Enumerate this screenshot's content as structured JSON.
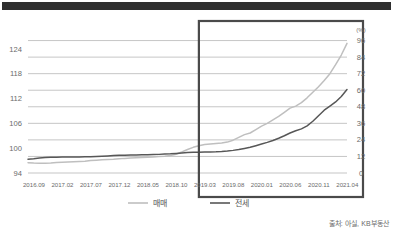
{
  "figure": {
    "topbar_name": "header-rule",
    "source": "출처: 아실, KB부동산"
  },
  "chart_data": {
    "type": "line",
    "title": "",
    "subtitle": "",
    "xlabel": "",
    "ylabel": "",
    "grid": true,
    "legend_position": "bottom",
    "categories": [
      "2016.09",
      "2016.10",
      "2016.11",
      "2016.12",
      "2017.01",
      "2017.02",
      "2017.03",
      "2017.04",
      "2017.05",
      "2017.06",
      "2017.07",
      "2017.08",
      "2017.09",
      "2017.10",
      "2017.11",
      "2017.12",
      "2018.01",
      "2018.02",
      "2018.03",
      "2018.04",
      "2018.05",
      "2018.06",
      "2018.07",
      "2018.08",
      "2018.09",
      "2018.10",
      "2018.11",
      "2018.12",
      "2019.01",
      "2019.02",
      "2019.03",
      "2019.04",
      "2019.05",
      "2019.06",
      "2019.07",
      "2019.08",
      "2019.09",
      "2019.10",
      "2019.11",
      "2019.12",
      "2020.01",
      "2020.02",
      "2020.03",
      "2020.04",
      "2020.05",
      "2020.06",
      "2020.07",
      "2020.08",
      "2020.09",
      "2020.10",
      "2020.11",
      "2020.12",
      "2021.01",
      "2021.02",
      "2021.03",
      "2021.04",
      "2021.05"
    ],
    "xtick_labels": [
      "2016.09",
      "2017.02",
      "2017.07",
      "2017.12",
      "2018.05",
      "2018.10",
      "2019.03",
      "2019.08",
      "2020.01",
      "2020.06",
      "2020.11",
      "2021.04"
    ],
    "xtick_indices": [
      0,
      5,
      10,
      15,
      20,
      25,
      30,
      35,
      40,
      45,
      50,
      55
    ],
    "left_axis": {
      "name": "index-axis",
      "ticks": [
        94,
        100,
        106,
        112,
        118,
        124
      ],
      "ylim": [
        94,
        130
      ]
    },
    "right_axis": {
      "name": "percent-axis",
      "unit": "(%)",
      "ticks": [
        0,
        12,
        24,
        36,
        48,
        60,
        72,
        84,
        96
      ],
      "ylim": [
        0,
        108
      ]
    },
    "series": [
      {
        "name": "매매",
        "axis": "right",
        "color": "#bfbfbf",
        "values": [
          7.5,
          7.2,
          7.0,
          7.0,
          7.2,
          7.6,
          7.8,
          8.0,
          8.2,
          8.4,
          8.6,
          9.0,
          9.3,
          9.6,
          9.8,
          10.0,
          10.3,
          10.6,
          10.8,
          11.0,
          11.2,
          11.4,
          11.6,
          11.9,
          12.2,
          12.6,
          13.6,
          15.2,
          17.0,
          18.6,
          19.8,
          20.6,
          21.0,
          21.4,
          21.8,
          22.4,
          23.8,
          25.8,
          27.8,
          29.0,
          31.5,
          34.0,
          36.0,
          38.5,
          41.0,
          44.0,
          47.0,
          48.5,
          51.0,
          54.5,
          58.5,
          62.5,
          67.0,
          72.0,
          78.5,
          85.5,
          94.0
        ]
      },
      {
        "name": "전세",
        "axis": "right",
        "color": "#575757",
        "values": [
          10.0,
          10.4,
          10.9,
          11.2,
          11.4,
          11.5,
          11.6,
          11.6,
          11.6,
          11.6,
          11.7,
          11.8,
          12.0,
          12.2,
          12.4,
          12.6,
          12.8,
          12.9,
          13.0,
          13.1,
          13.2,
          13.3,
          13.4,
          13.5,
          13.7,
          13.9,
          14.2,
          14.5,
          14.8,
          15.0,
          15.1,
          15.2,
          15.3,
          15.4,
          15.6,
          15.9,
          16.4,
          17.0,
          17.8,
          18.6,
          19.8,
          21.0,
          22.2,
          23.6,
          25.2,
          27.0,
          29.0,
          30.6,
          32.0,
          34.2,
          37.5,
          41.5,
          45.5,
          48.5,
          51.5,
          55.5,
          60.5
        ]
      }
    ],
    "highlight_box": {
      "name": "highlight-region",
      "from": "2019.03",
      "to": "2021.05",
      "color": "#4a4a4a"
    }
  },
  "legend": {
    "items": [
      {
        "label": "매매",
        "color": "#bfbfbf"
      },
      {
        "label": "전세",
        "color": "#575757"
      }
    ]
  }
}
